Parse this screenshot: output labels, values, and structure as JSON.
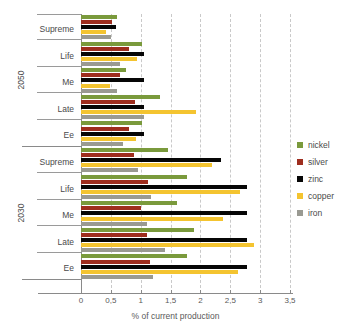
{
  "chart_data": {
    "type": "bar",
    "orientation": "horizontal",
    "title": "",
    "xlabel": "% of current production",
    "ylabel": "",
    "xlim": [
      0,
      3.5
    ],
    "xticks": [
      0,
      0.5,
      1,
      1.5,
      2,
      2.5,
      3,
      3.5
    ],
    "xtick_labels": [
      "0",
      "0,5",
      "1",
      "1,5",
      "2",
      "2,5",
      "3",
      "3,5"
    ],
    "grid": "vertical-dashed",
    "legend_position": "right",
    "decimal_separator": ",",
    "groups": [
      {
        "label": "2050",
        "categories": [
          "Supreme",
          "Life",
          "Me",
          "Late",
          "Ee"
        ]
      },
      {
        "label": "2030",
        "categories": [
          "Supreme",
          "Life",
          "Me",
          "Late",
          "Ee"
        ]
      }
    ],
    "categories": [
      "Supreme",
      "Life",
      "Me",
      "Late",
      "Ee"
    ],
    "series": [
      {
        "name": "nickel",
        "color": "#7a9a3c",
        "values_2050": [
          0.6,
          1.02,
          0.75,
          1.33,
          1.02
        ],
        "values_2030": [
          1.45,
          1.78,
          1.6,
          1.9,
          1.78
        ]
      },
      {
        "name": "silver",
        "color": "#9e2d1e",
        "values_2050": [
          0.52,
          0.8,
          0.65,
          0.91,
          0.8
        ],
        "values_2030": [
          0.88,
          1.13,
          1.0,
          1.1,
          1.15
        ]
      },
      {
        "name": "zinc",
        "color": "#060606",
        "values_2050": [
          0.58,
          1.05,
          1.05,
          1.05,
          1.05
        ],
        "values_2030": [
          2.35,
          2.78,
          2.78,
          2.78,
          2.78
        ]
      },
      {
        "name": "copper",
        "color": "#f4c430",
        "values_2050": [
          0.42,
          0.93,
          0.48,
          1.92,
          0.92
        ],
        "values_2030": [
          2.2,
          2.67,
          2.37,
          2.9,
          2.63
        ]
      },
      {
        "name": "iron",
        "color": "#9a9a92",
        "values_2050": [
          0.5,
          0.65,
          0.6,
          1.06,
          0.7
        ],
        "values_2030": [
          0.95,
          1.17,
          1.1,
          1.41,
          1.2
        ]
      }
    ],
    "legend": [
      {
        "label": "nickel",
        "color": "#7a9a3c"
      },
      {
        "label": "silver",
        "color": "#9e2d1e"
      },
      {
        "label": "zinc",
        "color": "#060606"
      },
      {
        "label": "copper",
        "color": "#f4c430"
      },
      {
        "label": "iron",
        "color": "#9a9a92"
      }
    ]
  }
}
